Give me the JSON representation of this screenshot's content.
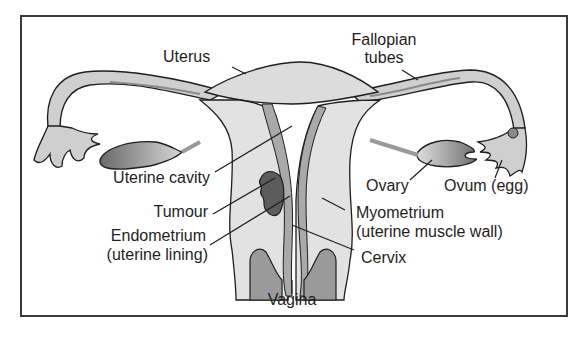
{
  "diagram": {
    "type": "anatomical-illustration",
    "colors": {
      "outline": "#1e1e1e",
      "tissue_light": "#e4e4e4",
      "tissue_mid": "#b9b9b9",
      "tissue_dark": "#8a8a8a",
      "tumour": "#5c5c5c",
      "frame": "#3a3a3a",
      "background": "#ffffff"
    },
    "labels": {
      "uterus": "Uterus",
      "fallopian_line1": "Fallopian",
      "fallopian_line2": "tubes",
      "uterine_cavity": "Uterine cavity",
      "tumour": "Tumour",
      "endometrium_line1": "Endometrium",
      "endometrium_line2": "(uterine lining)",
      "ovary": "Ovary",
      "ovum": "Ovum (egg)",
      "myometrium_line1": "Myometrium",
      "myometrium_line2": "(uterine muscle wall)",
      "cervix": "Cervix",
      "vagina": "Vagina"
    }
  }
}
